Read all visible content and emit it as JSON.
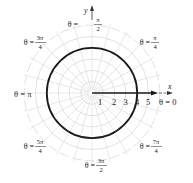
{
  "figure": {
    "type": "polar_graph",
    "curve_equation_shown": "r = 4 (circle) with segment along θ = 0",
    "colors": {
      "grid": "#d6d6d6",
      "curve": "#1a1a1a",
      "text": "#222222"
    }
  },
  "axes": {
    "x_label": "x",
    "y_label": "y"
  },
  "radial_ticks": [
    "1",
    "2",
    "3",
    "4",
    "5"
  ],
  "angle_labels": {
    "theta_0": {
      "prefix": "θ = ",
      "value": "0"
    },
    "theta_pi_4": {
      "prefix": "θ = ",
      "num": "π",
      "den": "4"
    },
    "theta_pi_2": {
      "prefix": "θ = ",
      "num": "π",
      "den": "2"
    },
    "theta_3pi_4": {
      "prefix": "θ = ",
      "num": "3π",
      "den": "4"
    },
    "theta_pi": {
      "prefix": "θ = ",
      "value": "π"
    },
    "theta_5pi_4": {
      "prefix": "θ = ",
      "num": "5π",
      "den": "4"
    },
    "theta_3pi_2": {
      "prefix": "θ = ",
      "num": "3π",
      "den": "2"
    },
    "theta_7pi_4": {
      "prefix": "θ = ",
      "num": "7π",
      "den": "4"
    }
  }
}
